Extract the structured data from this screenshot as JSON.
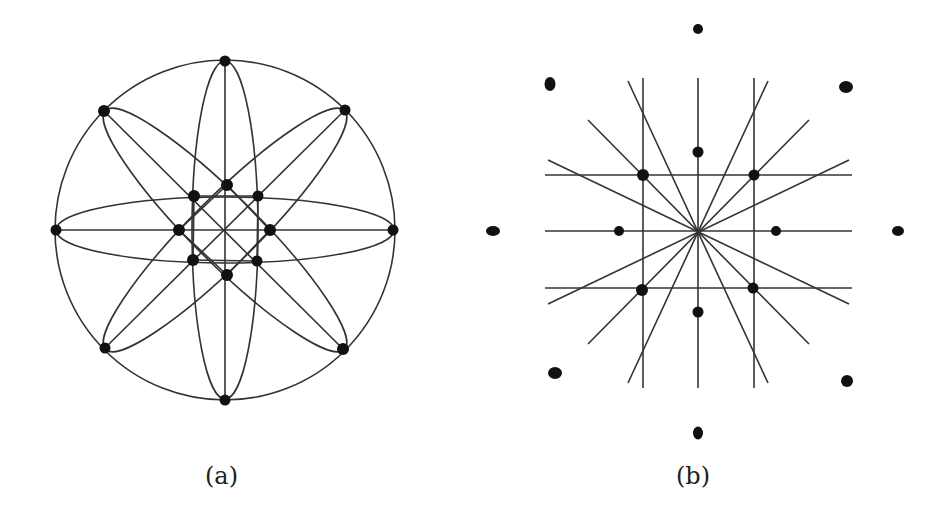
{
  "figure": {
    "panels": [
      {
        "label": "(a)",
        "description": "Circle with 8 boundary nodes connected by 4 diameters and 4 elongated ellipses (petals), with 8 inner nodes forming an octagon",
        "outer_circle": {
          "cx": 225,
          "cy": 230,
          "r": 170
        },
        "outer_nodes": [
          [
            225,
            61
          ],
          [
            345,
            110
          ],
          [
            393,
            230
          ],
          [
            343,
            349
          ],
          [
            225,
            400
          ],
          [
            105,
            348
          ],
          [
            56,
            230
          ],
          [
            104,
            111
          ]
        ],
        "inner_nodes": [
          [
            227,
            185
          ],
          [
            258,
            196
          ],
          [
            270,
            230
          ],
          [
            257,
            261
          ],
          [
            227,
            275
          ],
          [
            193,
            260
          ],
          [
            179,
            230
          ],
          [
            194,
            196
          ]
        ]
      },
      {
        "label": "(b)",
        "description": "Grid of 3 vertical, 3 horizontal and 6 diagonal lines with 8 inner nodes and 8 outer isolated nodes",
        "vertical_lines_x": [
          643,
          698,
          754
        ],
        "horizontal_lines_y": [
          175,
          231,
          288
        ],
        "inner_nodes": [
          [
            698,
            152
          ],
          [
            754,
            175
          ],
          [
            776,
            231
          ],
          [
            753,
            288
          ],
          [
            698,
            312
          ],
          [
            642,
            290
          ],
          [
            619,
            231
          ],
          [
            643,
            175
          ]
        ],
        "outer_nodes": [
          [
            698,
            29
          ],
          [
            846,
            87
          ],
          [
            898,
            231
          ],
          [
            847,
            381
          ],
          [
            698,
            433
          ],
          [
            555,
            373
          ],
          [
            493,
            231
          ],
          [
            550,
            84
          ]
        ]
      }
    ]
  }
}
